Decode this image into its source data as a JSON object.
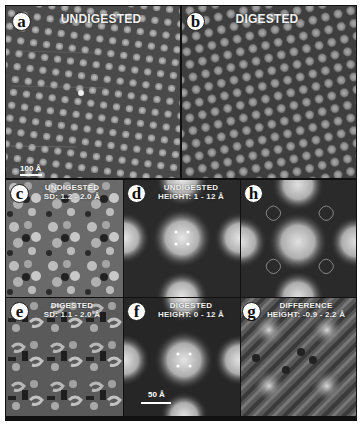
{
  "figure": {
    "panels": {
      "a": {
        "label": "a",
        "title": "UNDIGESTED",
        "scale_bar": "100 Å"
      },
      "b": {
        "label": "b",
        "title": "DIGESTED"
      },
      "c": {
        "label": "c",
        "title_line1": "UNDIGESTED",
        "title_line2": "SD: 1.2 - 2.0 Å"
      },
      "d": {
        "label": "d",
        "title_line1": "UNDIGESTED",
        "title_line2": "HEIGHT: 1 - 12 Å"
      },
      "h": {
        "label": "h"
      },
      "e": {
        "label": "e",
        "title_line1": "DIGESTED",
        "title_line2": "SD: 1.1 - 2.0 Å"
      },
      "f": {
        "label": "f",
        "title_line1": "DIGESTED",
        "title_line2": "HEIGHT: 0 - 12 Å",
        "scale_bar": "50 Å"
      },
      "g": {
        "label": "g",
        "title_line1": "DIFFERENCE",
        "title_line2": "HEIGHT: -0.9 - 2.2 Å"
      }
    },
    "colors": {
      "background": "#ffffff",
      "frame": "#111111",
      "label_fill": "#ffffff",
      "text": "#f2f2f2"
    }
  }
}
